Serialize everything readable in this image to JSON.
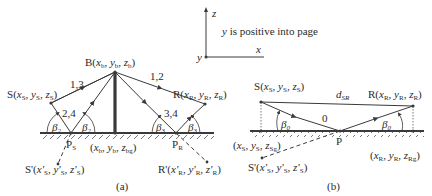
{
  "axes_legend": {
    "z_label": "z",
    "x_label": "x",
    "y_label": "y",
    "note": "y is positive into page"
  },
  "panel_a": {
    "caption": "(a)",
    "barrier_top": {
      "name": "B",
      "coords": [
        "x",
        "y",
        "z"
      ],
      "subs": [
        "b",
        "b",
        "b"
      ]
    },
    "barrier_base": {
      "coords": [
        "x",
        "y",
        "z"
      ],
      "subs": [
        "b",
        "b",
        "bg"
      ]
    },
    "source": {
      "name": "S",
      "coords": [
        "x",
        "y",
        "z"
      ],
      "subs": [
        "S",
        "S",
        "S"
      ]
    },
    "receiver": {
      "name": "R",
      "coords": [
        "x",
        "y",
        "z"
      ],
      "subs": [
        "R",
        "R",
        "R"
      ]
    },
    "image_source": {
      "name": "S'",
      "coords": [
        "x'",
        "y'",
        "z'"
      ],
      "subs": [
        "S",
        "S",
        "S"
      ]
    },
    "image_receiver": {
      "name": "R'",
      "coords": [
        "x'",
        "y'",
        "z'"
      ],
      "subs": [
        "R",
        "R",
        "R"
      ]
    },
    "reflection_point_source": {
      "name": "P",
      "sub": "S"
    },
    "reflection_point_receiver": {
      "name": "P",
      "sub": "R"
    },
    "path_labels": [
      "1,3",
      "1,2",
      "2,4",
      "3,4"
    ],
    "angles": [
      "β",
      "β",
      "β",
      "β"
    ],
    "angle_subs": [
      "2",
      "2",
      "3",
      "3"
    ]
  },
  "panel_b": {
    "caption": "(b)",
    "source": {
      "name": "S",
      "coords": [
        "x",
        "y",
        "z"
      ],
      "subs": [
        "S",
        "S",
        "S"
      ]
    },
    "receiver": {
      "name": "R",
      "coords": [
        "x",
        "y",
        "z"
      ],
      "subs": [
        "R",
        "R",
        "R"
      ]
    },
    "source_ground": {
      "coords": [
        "x",
        "y",
        "z"
      ],
      "subs": [
        "S",
        "S",
        "Sg"
      ]
    },
    "receiver_ground": {
      "coords": [
        "x",
        "y",
        "z"
      ],
      "subs": [
        "R",
        "R",
        "Rg"
      ]
    },
    "image_source": {
      "name": "S'",
      "coords": [
        "x'",
        "y'",
        "z'"
      ],
      "subs": [
        "S",
        "S",
        "S"
      ]
    },
    "reflection_point": "P",
    "direct_label": "d",
    "direct_label_sub": "SR",
    "path_label": "0",
    "angles": [
      "β",
      "β"
    ],
    "angle_subs": [
      "0",
      "0"
    ]
  },
  "colors": {
    "line": "#3a3a3a",
    "text": "#2a2a2a",
    "background": "#ffffff"
  }
}
